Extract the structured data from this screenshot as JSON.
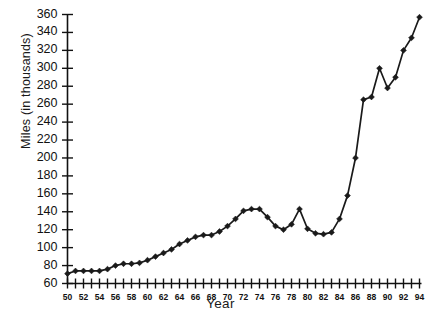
{
  "chart_data": {
    "type": "line",
    "title": "",
    "subtitle": "",
    "xlabel": "Year",
    "ylabel": "Miles (in thousands)",
    "xlim": [
      50,
      94
    ],
    "ylim": [
      60,
      360
    ],
    "grid": false,
    "legend": null,
    "legend_position": "none",
    "marker": "filled-diamond",
    "line_color": "#1a1a1a",
    "marker_color": "#1a1a1a",
    "y_ticks": [
      60,
      80,
      100,
      120,
      140,
      160,
      180,
      200,
      220,
      240,
      260,
      280,
      300,
      320,
      340,
      360
    ],
    "y_tick_labels": [
      "60",
      "80",
      "100",
      "120",
      "140",
      "160",
      "180",
      "200",
      "220",
      "240",
      "260",
      "280",
      "300",
      "320",
      "340",
      "360"
    ],
    "y_minor_tick_step": 20,
    "x_ticks_all": [
      50,
      51,
      52,
      53,
      54,
      55,
      56,
      57,
      58,
      59,
      60,
      61,
      62,
      63,
      64,
      65,
      66,
      67,
      68,
      69,
      70,
      71,
      72,
      73,
      74,
      75,
      76,
      77,
      78,
      79,
      80,
      81,
      82,
      83,
      84,
      85,
      86,
      87,
      88,
      89,
      90,
      91,
      92,
      93,
      94
    ],
    "x_labeled_ticks": [
      50,
      52,
      54,
      56,
      58,
      60,
      62,
      64,
      66,
      68,
      70,
      72,
      74,
      76,
      78,
      80,
      82,
      84,
      86,
      88,
      90,
      92,
      94
    ],
    "x_tick_labels": [
      "50",
      "52",
      "54",
      "56",
      "58",
      "60",
      "62",
      "64",
      "66",
      "68",
      "70",
      "72",
      "74",
      "76",
      "78",
      "80",
      "82",
      "84",
      "86",
      "88",
      "90",
      "92",
      "94"
    ],
    "x": [
      50,
      51,
      52,
      53,
      54,
      55,
      56,
      57,
      58,
      59,
      60,
      61,
      62,
      63,
      64,
      65,
      66,
      67,
      68,
      69,
      70,
      71,
      72,
      73,
      74,
      75,
      76,
      77,
      78,
      79,
      80,
      81,
      82,
      83,
      84,
      85,
      86,
      87,
      88,
      89,
      90,
      91,
      92,
      93,
      94
    ],
    "values": [
      71,
      74,
      74,
      74,
      74,
      76,
      80,
      82,
      82,
      83,
      86,
      90,
      94,
      98,
      104,
      108,
      112,
      114,
      114,
      118,
      124,
      132,
      141,
      143,
      143,
      134,
      124,
      120,
      126,
      143,
      121,
      116,
      115,
      117,
      132,
      158,
      200,
      265,
      268,
      300,
      278,
      290,
      320,
      334,
      357
    ],
    "annotations": []
  }
}
